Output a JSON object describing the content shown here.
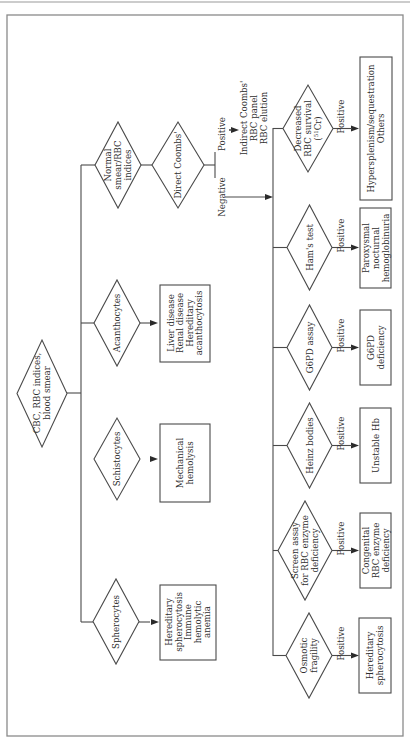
{
  "flowchart": {
    "start": {
      "lines": [
        "CBC, RBC indices,",
        "blood smear"
      ]
    },
    "smear_branches": [
      {
        "id": "normal",
        "decision": [
          "Normal",
          "smear/RBC",
          "indices"
        ]
      },
      {
        "id": "acanthocytes",
        "decision": [
          "Acanthocytes"
        ],
        "result": [
          "Liver disease",
          "Renal disease",
          "Hereditary",
          "   acanthocytosis"
        ]
      },
      {
        "id": "schistocytes",
        "decision": [
          "Schistocytes"
        ],
        "result": [
          "Mechanical",
          "hemolysis"
        ]
      },
      {
        "id": "spherocytes",
        "decision": [
          "Spherocytes"
        ],
        "result": [
          "Hereditary",
          "  spherocytosis",
          "Immune",
          "  hemolytic",
          "  anemia"
        ]
      }
    ],
    "coombs": {
      "decision": [
        "Direct Coombs'"
      ],
      "positive_label": "Positive",
      "negative_label": "Negative",
      "positive_result": [
        "Indirect Coombs'",
        "RBC panel",
        "RBC elution"
      ]
    },
    "negative_tests": [
      {
        "id": "decreased-survival",
        "decision": [
          "Decreased",
          "RBC survival",
          "(51Cr)"
        ],
        "edge": "Positive",
        "result": [
          "Hypersplenism/sequestration",
          "Others"
        ]
      },
      {
        "id": "hams",
        "decision": [
          "Ham's test"
        ],
        "edge": "Positive",
        "result": [
          "Paroxysmal",
          "nocturnal",
          "hemoglobinuria"
        ]
      },
      {
        "id": "g6pd",
        "decision": [
          "G6PD assay"
        ],
        "edge": "Positive",
        "result": [
          "G6PD",
          "deficiency"
        ]
      },
      {
        "id": "heinz",
        "decision": [
          "Heinz bodies"
        ],
        "edge": "Positive",
        "result": [
          "Unstable Hb"
        ]
      },
      {
        "id": "screen",
        "decision": [
          "Screen assay",
          "for RBC enzyme",
          "deficiency"
        ],
        "edge": "Positive",
        "result": [
          "Congenital",
          "RBC enzyme",
          "deficiency"
        ]
      },
      {
        "id": "osmotic",
        "decision": [
          "Osmotic",
          "fragility"
        ],
        "edge": "Positive",
        "result": [
          "Hereditary",
          "spherocytosis"
        ]
      }
    ]
  }
}
